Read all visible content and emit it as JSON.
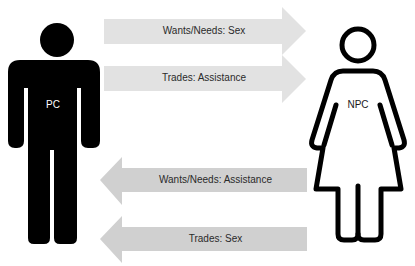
{
  "colors": {
    "background": "#ffffff",
    "figure": "#000000",
    "arrow_to_npc": "#e2e2e2",
    "arrow_to_pc": "#d0d0d0",
    "text": "#2a2a2a",
    "pc_label": "#ffffff",
    "npc_label": "#1a1a1a"
  },
  "figures": {
    "pc": {
      "label": "PC",
      "icon": "male-person-icon"
    },
    "npc": {
      "label": "NPC",
      "icon": "female-person-icon"
    }
  },
  "arrows": [
    {
      "direction": "right",
      "label": "Wants/Needs: Sex"
    },
    {
      "direction": "right",
      "label": "Trades: Assistance"
    },
    {
      "direction": "left",
      "label": "Wants/Needs: Assistance"
    },
    {
      "direction": "left",
      "label": "Trades: Sex"
    }
  ]
}
